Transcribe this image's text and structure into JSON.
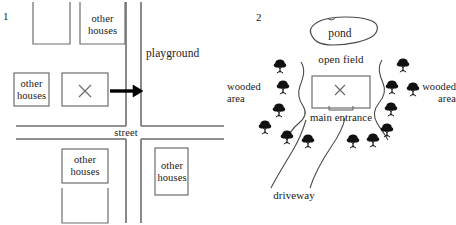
{
  "figure": {
    "panels": [
      {
        "number": "1",
        "caption_labels": {
          "playground": "playground",
          "street": "street",
          "house_top_mid": "other\nhouses",
          "house_left_mid": "other\nhouses",
          "house_bottom_mid": "other\nhouses",
          "house_bottom_right": "other\nhouses",
          "target_mark": "×"
        },
        "streets": {
          "vertical_west_x": 126,
          "vertical_east_x": 141,
          "horizontal_north_y": 126,
          "horizontal_south_y": 139
        },
        "blocks": [
          {
            "name": "house-block-top-left",
            "label": "",
            "x": 33,
            "y": 8,
            "w": 37,
            "h": 36
          },
          {
            "name": "house-block-top-mid",
            "label": "other\nhouses",
            "x": 80,
            "y": 8,
            "w": 45,
            "h": 36
          },
          {
            "name": "house-block-left-mid",
            "label": "other\nhouses",
            "x": 14,
            "y": 73,
            "w": 35,
            "h": 33
          },
          {
            "name": "house-block-center-x",
            "label": "×",
            "x": 62,
            "y": 73,
            "w": 46,
            "h": 33
          },
          {
            "name": "house-block-bottom-mid",
            "label": "other\nhouses",
            "x": 62,
            "y": 149,
            "w": 46,
            "h": 34
          },
          {
            "name": "house-block-bottom-lower",
            "label": "",
            "x": 62,
            "y": 188,
            "w": 46,
            "h": 30
          },
          {
            "name": "house-block-bottom-right",
            "label": "other\nhouses",
            "x": 155,
            "y": 148,
            "w": 33,
            "h": 47
          }
        ],
        "arrow": {
          "name": "direction-arrow",
          "x1": 110,
          "y1": 91,
          "x2": 142,
          "y2": 91
        }
      },
      {
        "number": "2",
        "caption_labels": {
          "pond": "pond",
          "open_field": "open field",
          "main_entrance": "main entrance",
          "wooded_area_left": "wooded\narea",
          "wooded_area_right": "wooded\narea",
          "driveway": "driveway",
          "target_mark": "×"
        },
        "house": {
          "name": "house-outline",
          "x": 85,
          "y": 76,
          "w": 58,
          "h": 32
        },
        "pond": {
          "name": "pond-outline",
          "cx": 112,
          "cy": 36,
          "rx": 35,
          "ry": 12,
          "rotate": -6
        },
        "tree_count_left": 6,
        "tree_count_right": 7,
        "tree_icon_name": "tree-icon"
      }
    ]
  }
}
